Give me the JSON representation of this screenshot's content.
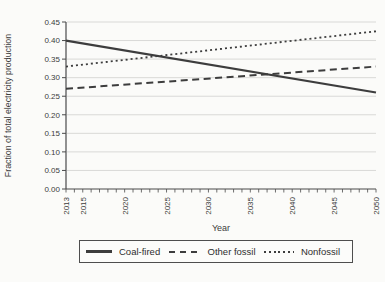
{
  "chart_data": {
    "type": "line",
    "title": "",
    "xlabel": "Year",
    "ylabel": "Fraction of total electricity production",
    "x_range": [
      2013,
      2050
    ],
    "x_tick_labels": [
      "2013",
      "2015",
      "2020",
      "2025",
      "2030",
      "2035",
      "2040",
      "2045",
      "2050"
    ],
    "x_minor_tick_step": 1,
    "ylim": [
      0,
      0.45
    ],
    "y_tick_step": 0.05,
    "y_tick_labels": [
      "0.00",
      "0.05",
      "0.10",
      "0.15",
      "0.20",
      "0.25",
      "0.30",
      "0.35",
      "0.40",
      "0.45"
    ],
    "grid": "horizontal gridlines at each y tick",
    "legend_position": "bottom boxed",
    "series": [
      {
        "name": "Coal-fired",
        "line_style": "solid",
        "x": [
          2013,
          2050
        ],
        "y": [
          0.4,
          0.26
        ]
      },
      {
        "name": "Other fossil",
        "line_style": "dashed",
        "x": [
          2013,
          2050
        ],
        "y": [
          0.27,
          0.33
        ]
      },
      {
        "name": "Nonfossil",
        "line_style": "dotted",
        "x": [
          2013,
          2050
        ],
        "y": [
          0.33,
          0.425
        ]
      }
    ],
    "colors": {
      "line": "#3d3d3d",
      "grid": "#d9d9d7",
      "axis": "#4a4a4a",
      "text": "#3c3c3c"
    }
  }
}
